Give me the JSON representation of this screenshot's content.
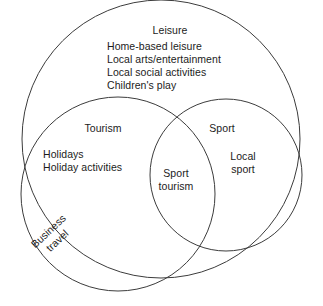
{
  "figure": {
    "type": "venn-diagram",
    "set_count": 3,
    "background_color": "#ffffff",
    "stroke_color": "#3c3c3c",
    "text_color": "#1c1c1c"
  },
  "regions": {
    "leisure": {
      "title": "Leisure",
      "items_text": "Home-based leisure\nLocal arts/entertainment\nLocal social activities\nChildren's play",
      "items": [
        "Home-based leisure",
        "Local arts/entertainment",
        "Local social activities",
        "Children's play"
      ]
    },
    "tourism": {
      "title": "Tourism",
      "items_text": "Holidays\nHoliday activities",
      "items": [
        "Holidays",
        "Holiday activities"
      ]
    },
    "sport": {
      "title": "Sport",
      "items_text": "Local\nsport",
      "items": [
        "Local",
        "sport"
      ]
    },
    "sport_tourism_overlap": {
      "items_text": "Sport\ntourism",
      "items": [
        "Sport",
        "tourism"
      ]
    },
    "business_travel": {
      "items_text": "Business\ntravel",
      "items": [
        "Business",
        "travel"
      ],
      "rotation_degrees": -43
    }
  }
}
